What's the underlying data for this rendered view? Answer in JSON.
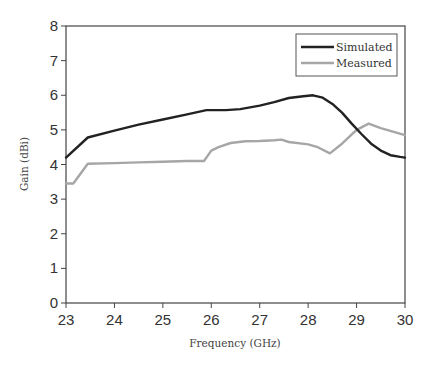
{
  "chart_data": {
    "type": "line",
    "title": "",
    "xlabel": "Frequency (GHz)",
    "ylabel": "Gain (dBi)",
    "xlim": [
      23,
      30
    ],
    "ylim": [
      0,
      8
    ],
    "xticks": [
      23,
      24,
      25,
      26,
      27,
      28,
      29,
      30
    ],
    "yticks": [
      0,
      1,
      2,
      3,
      4,
      5,
      6,
      7,
      8
    ],
    "grid": false,
    "legend_position": "upper right",
    "series": [
      {
        "name": "Simulated",
        "color": "#222222",
        "x": [
          23.0,
          23.45,
          24.0,
          24.5,
          25.0,
          25.5,
          25.9,
          26.3,
          26.6,
          27.0,
          27.3,
          27.6,
          27.9,
          28.1,
          28.3,
          28.5,
          28.7,
          28.9,
          29.1,
          29.3,
          29.5,
          29.7,
          29.9,
          30.0
        ],
        "values": [
          4.2,
          4.78,
          4.98,
          5.15,
          5.3,
          5.45,
          5.57,
          5.57,
          5.6,
          5.7,
          5.8,
          5.92,
          5.97,
          6.0,
          5.93,
          5.75,
          5.5,
          5.18,
          4.88,
          4.6,
          4.4,
          4.27,
          4.22,
          4.2
        ]
      },
      {
        "name": "Measured",
        "color": "#a6a6a6",
        "x": [
          23.0,
          23.15,
          23.45,
          24.0,
          24.5,
          25.0,
          25.5,
          25.85,
          26.0,
          26.15,
          26.4,
          26.7,
          27.0,
          27.3,
          27.45,
          27.6,
          28.0,
          28.2,
          28.45,
          28.7,
          29.0,
          29.25,
          29.5,
          30.0
        ],
        "values": [
          3.45,
          3.45,
          4.02,
          4.04,
          4.06,
          4.08,
          4.1,
          4.1,
          4.4,
          4.5,
          4.62,
          4.67,
          4.68,
          4.7,
          4.72,
          4.65,
          4.58,
          4.5,
          4.32,
          4.6,
          5.0,
          5.18,
          5.05,
          4.85
        ]
      }
    ]
  },
  "legend": {
    "items": [
      {
        "label": "Simulated",
        "color": "#222222"
      },
      {
        "label": "Measured",
        "color": "#a6a6a6"
      }
    ]
  },
  "axes": {
    "x_title": "Frequency (GHz)",
    "y_title": "Gain (dBi)"
  }
}
